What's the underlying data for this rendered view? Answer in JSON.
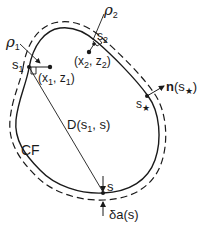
{
  "diagram": {
    "colors": {
      "stroke": "#1a1a1a",
      "background": "#ffffff"
    },
    "labels": {
      "rho1": {
        "base": "ρ",
        "sub": "1"
      },
      "rho2": {
        "base": "ρ",
        "sub": "2"
      },
      "s1": {
        "base": "s",
        "sub": "1"
      },
      "s2": {
        "base": "s",
        "sub": "2"
      },
      "x1z1": {
        "open": "(x",
        "sub1": "1",
        "mid": ", z",
        "sub2": "1",
        "close": ")"
      },
      "x2z2": {
        "open": "(x",
        "sub1": "2",
        "mid": ", z",
        "sub2": "2",
        "close": ")"
      },
      "s_star": {
        "base": "s",
        "sub": "★"
      },
      "normal": {
        "bold": "n",
        "open": "(s",
        "sub": "★",
        "close": ")"
      },
      "distance": {
        "open": "D(s",
        "sub": "1",
        "rest": ", s)"
      },
      "contour": "CF",
      "s": "s",
      "delta_a": "δa(s)"
    }
  }
}
